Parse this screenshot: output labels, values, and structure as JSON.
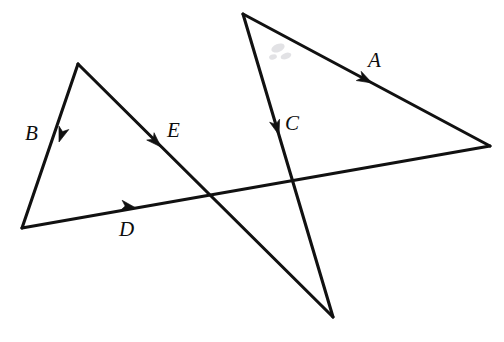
{
  "figure": {
    "name": "vector-polygon-diagram",
    "width": 504,
    "height": 342,
    "background_color": "#ffffff",
    "line_color": "#111111",
    "label_color": "#0d0d0d"
  },
  "vectors": [
    {
      "id": "A",
      "label": "A",
      "from": [
        490,
        146
      ],
      "to": [
        243,
        14
      ],
      "arrow_at": [
        372,
        83
      ],
      "arrow_direction": "up-left",
      "label_pos": [
        368,
        50
      ]
    },
    {
      "id": "B",
      "label": "B",
      "from": [
        22,
        228
      ],
      "to": [
        78,
        64
      ],
      "arrow_at": [
        59,
        142
      ],
      "arrow_direction": "up-right",
      "label_pos": [
        25,
        123
      ]
    },
    {
      "id": "C",
      "label": "C",
      "from": [
        333,
        317
      ],
      "to": [
        243,
        14
      ],
      "arrow_at": [
        279,
        135
      ],
      "arrow_direction": "up",
      "label_pos": [
        285,
        113
      ]
    },
    {
      "id": "D",
      "label": "D",
      "from": [
        490,
        146
      ],
      "to": [
        22,
        228
      ],
      "arrow_at": [
        136,
        208
      ],
      "arrow_direction": "left",
      "label_pos": [
        119,
        219
      ]
    },
    {
      "id": "E",
      "label": "E",
      "from": [
        333,
        317
      ],
      "to": [
        78,
        64
      ],
      "arrow_at": [
        161,
        147
      ],
      "arrow_direction": "up-left",
      "label_pos": [
        167,
        120
      ]
    }
  ],
  "vertices": [
    {
      "name": "left-apex",
      "point": [
        78,
        64
      ]
    },
    {
      "name": "left-bottom",
      "point": [
        22,
        228
      ]
    },
    {
      "name": "right-top",
      "point": [
        243,
        14
      ]
    },
    {
      "name": "right-far",
      "point": [
        490,
        146
      ]
    },
    {
      "name": "bottom-cusp",
      "point": [
        333,
        317
      ]
    }
  ],
  "artifacts": [
    {
      "name": "scan-smudge",
      "point": [
        281,
        52
      ]
    }
  ]
}
